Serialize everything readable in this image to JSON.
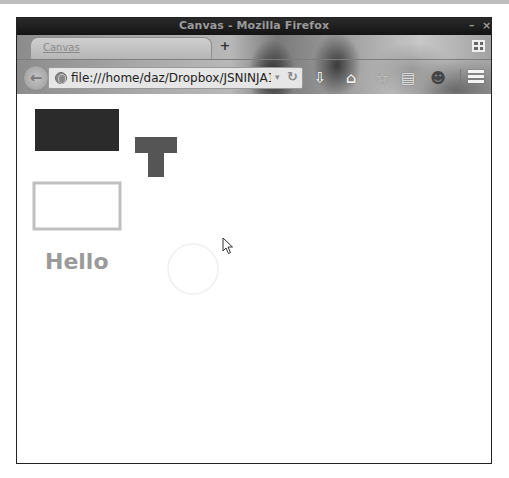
{
  "window": {
    "title": "Canvas - Mozilla Firefox",
    "controls": {
      "minimize": "–",
      "close": "×"
    }
  },
  "tabs": [
    {
      "label": "Canvas",
      "active": true
    }
  ],
  "new_tab_label": "+",
  "navbar": {
    "back_glyph": "←",
    "url": "file:///home/daz/Dropbox/JSNINJA1/5 Co",
    "dropdown_glyph": "▾",
    "reload_glyph": "↻",
    "icons": [
      {
        "name": "download-icon",
        "glyph": "⇩"
      },
      {
        "name": "home-icon",
        "glyph": "⌂"
      },
      {
        "name": "bookmark-star-icon",
        "glyph": "☆"
      },
      {
        "name": "reading-list-icon",
        "glyph": "▤"
      },
      {
        "name": "persona-icon",
        "glyph": "☻"
      }
    ]
  },
  "canvas": {
    "filled_rect": {
      "x": 18,
      "y": 15,
      "w": 84,
      "h": 42,
      "color": "#2b2b2b"
    },
    "t_shape": {
      "color": "#555555",
      "bar": {
        "x": 118,
        "y": 43,
        "w": 42,
        "h": 16
      },
      "stem": {
        "x": 131,
        "y": 59,
        "w": 16,
        "h": 24
      }
    },
    "stroked_rect": {
      "x": 17,
      "y": 89,
      "w": 86,
      "h": 46,
      "stroke": "#bfbfbf",
      "line_width": 3
    },
    "text": {
      "value": "Hello",
      "x": 28,
      "y": 175,
      "color": "#9a9a9a",
      "size": 22
    },
    "circle": {
      "cx": 176,
      "cy": 175,
      "r": 25,
      "stroke": "#efefef"
    }
  }
}
